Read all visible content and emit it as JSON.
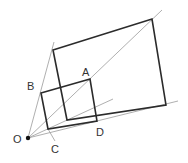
{
  "diagram": {
    "type": "geometry-homothety",
    "points": {
      "O": {
        "label": "O",
        "x": 28,
        "y": 138
      },
      "A": {
        "label": "A",
        "x": 90,
        "y": 79
      },
      "B": {
        "label": "B",
        "x": 41,
        "y": 93
      },
      "C": {
        "label": "C",
        "x": 48,
        "y": 129
      },
      "D": {
        "label": "D",
        "x": 97,
        "y": 121
      }
    },
    "labels": [
      {
        "id": "O",
        "text": "O"
      },
      {
        "id": "A",
        "text": "A"
      },
      {
        "id": "B",
        "text": "B"
      },
      {
        "id": "C",
        "text": "C"
      },
      {
        "id": "D",
        "text": "D"
      }
    ],
    "small_square": [
      [
        41,
        93
      ],
      [
        90,
        79
      ],
      [
        97,
        121
      ],
      [
        48,
        129
      ]
    ],
    "large_square": [
      [
        53,
        50
      ],
      [
        152,
        19
      ],
      [
        166,
        105
      ],
      [
        67,
        120
      ]
    ],
    "colors": {
      "thick": "#2b2b2b",
      "thin": "#9a9a9a",
      "point": "#111111"
    }
  }
}
